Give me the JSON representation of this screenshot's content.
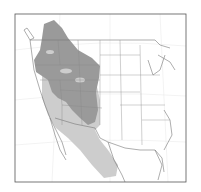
{
  "map": {
    "type": "species-range-map",
    "region": "Western North America",
    "frame": {
      "x": 15,
      "y": 14,
      "width": 171,
      "height": 168
    },
    "colors": {
      "background": "#ffffff",
      "frame": "#555555",
      "borders": "#777777",
      "graticule": "#e4e4e4",
      "range_primary": "#9a9a9a",
      "range_secondary": "#cdcdcd"
    },
    "legend": []
  }
}
